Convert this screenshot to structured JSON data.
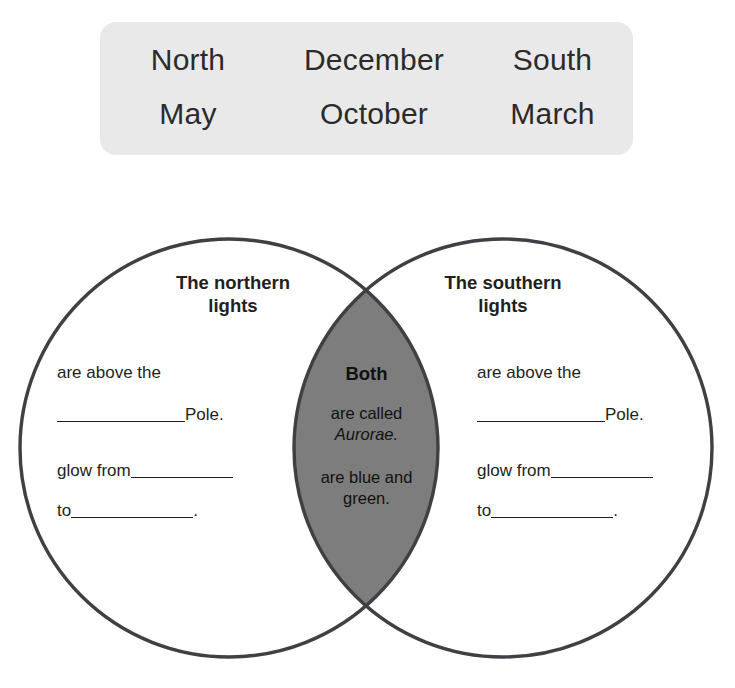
{
  "word_bank": {
    "rows": [
      [
        "North",
        "December",
        "South"
      ],
      [
        "May",
        "October",
        "March"
      ]
    ],
    "background_color": "#e9e9e9"
  },
  "venn": {
    "stroke_color": "#3f3f44",
    "overlap_fill_color": "#7d7d7d",
    "page_background": "#ffffff",
    "left": {
      "title_line1": "The northern",
      "title_line2": "lights",
      "line1_text": "are above the",
      "line2_suffix": "Pole.",
      "line3_prefix": "glow from",
      "line4_prefix": "to",
      "line4_suffix": "."
    },
    "right": {
      "title_line1": "The southern",
      "title_line2": "lights",
      "line1_text": "are above the",
      "line2_suffix": "Pole.",
      "line3_prefix": "glow from",
      "line4_prefix": "to",
      "line4_suffix": "."
    },
    "both": {
      "heading": "Both",
      "fact1_line1": "are called",
      "fact1_line2_italic": "Aurorae.",
      "fact2_line1": "are blue and",
      "fact2_line2": "green."
    }
  }
}
